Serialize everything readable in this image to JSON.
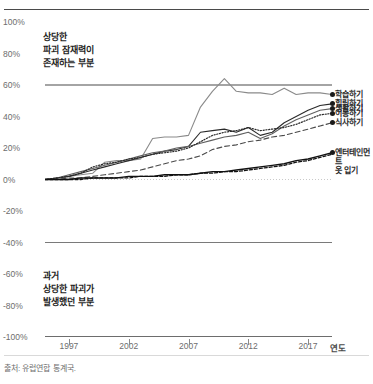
{
  "header": {
    "title": "",
    "title_visible": false
  },
  "source_note": "출처: 유럽연합 통계국.",
  "annotations": {
    "top": "상당한\n파괴 잠재력이\n존재하는 부분",
    "bottom": "과거\n상당한 파괴가\n발생했던 부분"
  },
  "axis": {
    "x_title": "연도",
    "y_ticks": [
      "100%",
      "80%",
      "60%",
      "40%",
      "20%",
      "0%",
      "-20%",
      "-40%",
      "-60%",
      "-80%",
      "-100%"
    ],
    "x_ticks": [
      "1997",
      "2002",
      "2007",
      "2012",
      "2017"
    ]
  },
  "legend": {
    "items": [
      {
        "label": "학습하기"
      },
      {
        "label": "힐링하기"
      },
      {
        "label": "생활하기"
      },
      {
        "label": "이동하기"
      },
      {
        "label": "식사하기"
      },
      {
        "label": "엔터테인먼트\n옷 입기"
      }
    ]
  },
  "colors": {
    "axis_text": "#6d6d6d",
    "line_dark": "#1f1f1f",
    "line_mid": "#555555",
    "line_grey": "#8a8a8a",
    "rule": "#4a4a4a",
    "grid": "#d9d9d9"
  },
  "chart_data": {
    "type": "line",
    "title": "",
    "xlabel": "연도",
    "ylabel": "",
    "ylim": [
      -100,
      100
    ],
    "xlim": [
      1995,
      2019
    ],
    "grid": false,
    "legend_position": "right",
    "x": [
      1995,
      1996,
      1997,
      1998,
      1999,
      2000,
      2001,
      2002,
      2003,
      2004,
      2005,
      2006,
      2007,
      2008,
      2009,
      2010,
      2011,
      2012,
      2013,
      2014,
      2015,
      2016,
      2017,
      2018,
      2019
    ],
    "series": [
      {
        "name": "학습하기",
        "style": "solid-grey",
        "values": [
          0,
          1,
          2,
          3,
          4,
          11,
          12,
          12,
          13,
          26,
          27,
          27,
          28,
          46,
          56,
          64,
          56,
          55,
          55,
          54,
          58,
          54,
          55,
          55,
          54
        ]
      },
      {
        "name": "힐링하기",
        "style": "solid-dark",
        "values": [
          0,
          1,
          2,
          4,
          6,
          8,
          10,
          12,
          14,
          16,
          18,
          19,
          21,
          30,
          31,
          32,
          30,
          33,
          28,
          30,
          36,
          40,
          44,
          47,
          48
        ]
      },
      {
        "name": "생활하기",
        "style": "solid-mid",
        "values": [
          0,
          1,
          3,
          5,
          7,
          9,
          11,
          13,
          15,
          17,
          18,
          20,
          21,
          23,
          25,
          27,
          28,
          30,
          26,
          29,
          34,
          38,
          41,
          44,
          45
        ]
      },
      {
        "name": "이동하기",
        "style": "dotted",
        "values": [
          0,
          1,
          2,
          4,
          8,
          10,
          11,
          13,
          14,
          16,
          17,
          18,
          20,
          24,
          28,
          30,
          31,
          33,
          31,
          32,
          33,
          35,
          38,
          41,
          42
        ]
      },
      {
        "name": "식사하기",
        "style": "dashed-long",
        "values": [
          0,
          0,
          1,
          1,
          2,
          3,
          4,
          5,
          6,
          8,
          10,
          12,
          13,
          15,
          19,
          21,
          22,
          24,
          25,
          27,
          28,
          30,
          32,
          34,
          36
        ]
      },
      {
        "name": "엔터테인먼트\n옷 입기",
        "style": "solid-black-thick",
        "values": [
          0,
          0,
          0,
          1,
          1,
          1,
          1,
          2,
          2,
          2,
          3,
          3,
          3,
          4,
          5,
          5,
          6,
          7,
          8,
          9,
          10,
          12,
          13,
          15,
          17
        ]
      },
      {
        "name": "엔터테인먼트-dash",
        "style": "dashed-short",
        "values": [
          0,
          0,
          0,
          0,
          1,
          1,
          1,
          1,
          2,
          2,
          2,
          3,
          3,
          4,
          4,
          5,
          5,
          6,
          7,
          8,
          9,
          11,
          12,
          14,
          16
        ]
      }
    ]
  }
}
